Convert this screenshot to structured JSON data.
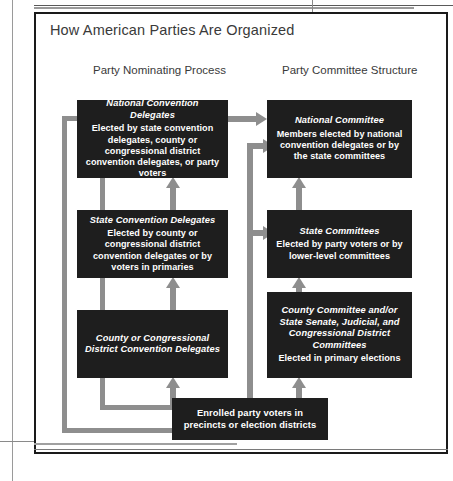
{
  "figure": {
    "title": "How American Parties Are Organized",
    "columns": [
      {
        "label": "Party Nominating Process"
      },
      {
        "label": "Party Committee Structure"
      }
    ],
    "accent_color": "#8e8e8e",
    "box_color": "#1e1e1e",
    "text_color": "#ffffff"
  },
  "boxes": {
    "national_convention_delegates": {
      "header": "National Convention Delegates",
      "body": "Elected by state convention delegates, county or congressional district convention delegates, or party voters"
    },
    "national_committee": {
      "header": "National Committee",
      "body": "Members elected by national convention delegates or by the state committees"
    },
    "state_convention_delegates": {
      "header": "State Convention Delegates",
      "body": "Elected by county or congressional district convention delegates or by voters in primaries"
    },
    "state_committees": {
      "header": "State Committees",
      "body": "Elected by party voters or by lower-level committees"
    },
    "county_convention_delegates": {
      "header": "County or Congressional District Convention Delegates"
    },
    "county_committees": {
      "header": "County Committee and/or State Senate, Judicial, and Congressional District Committees",
      "body": "Elected in primary elections"
    },
    "enrolled_party_voters": {
      "body": "Enrolled party voters in precincts or election districts"
    }
  }
}
